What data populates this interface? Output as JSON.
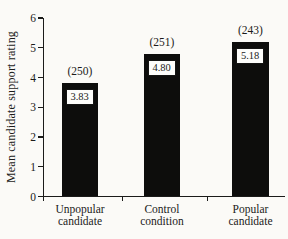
{
  "chart_data": {
    "type": "bar",
    "title": "",
    "ylabel": "Mean candidate support rating",
    "xlabel": "",
    "ylim": [
      0,
      6
    ],
    "ytick_labels": [
      "0",
      "1",
      "2",
      "3",
      "4",
      "5",
      "6"
    ],
    "categories": [
      "Unpopular candidate",
      "Control condition",
      "Popular candidate"
    ],
    "category_lines": [
      [
        "Unpopular",
        "candidate"
      ],
      [
        "Control",
        "condition"
      ],
      [
        "Popular",
        "candidate"
      ]
    ],
    "values": [
      3.83,
      4.8,
      5.18
    ],
    "value_labels": [
      "3.83",
      "4.80",
      "5.18"
    ],
    "n_labels": [
      "(250)",
      "(251)",
      "(243)"
    ],
    "bar_color": "#0d0d0c",
    "axis_color": "#1b1b1a",
    "background_color": "#fbfaf7",
    "grid": false,
    "legend": "none"
  }
}
